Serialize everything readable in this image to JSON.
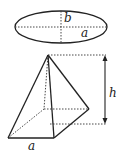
{
  "figure": {
    "ellipse": {
      "label_semi_major": "a",
      "label_semi_minor": "b"
    },
    "pyramid": {
      "label_base_edge": "a",
      "label_height": "h"
    }
  },
  "colors": {
    "stroke": "#222222",
    "background": "#ffffff"
  }
}
